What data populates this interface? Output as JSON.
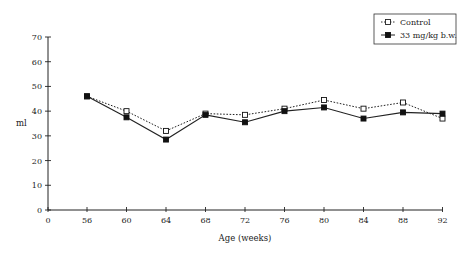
{
  "chart_data": {
    "type": "line",
    "title": "",
    "xlabel": "Age (weeks)",
    "ylabel": "ml",
    "xlim": [
      0,
      92
    ],
    "ylim": [
      0,
      70
    ],
    "x_ticks": [
      "0",
      "56",
      "60",
      "64",
      "68",
      "72",
      "76",
      "80",
      "84",
      "88",
      "92"
    ],
    "y_ticks": [
      "0",
      "10",
      "20",
      "30",
      "40",
      "50",
      "60",
      "70"
    ],
    "grid": false,
    "legend_position": "top-right",
    "x": [
      56,
      60,
      64,
      68,
      72,
      76,
      80,
      84,
      88,
      92
    ],
    "series": [
      {
        "name": "Control",
        "marker": "open-square",
        "line": "dotted",
        "values": [
          46,
          40,
          32,
          39,
          38.5,
          41,
          44.5,
          41,
          43.5,
          37
        ]
      },
      {
        "name": "33 mg/kg b.w.",
        "marker": "filled-square",
        "line": "solid",
        "values": [
          46,
          37.5,
          28.5,
          38.5,
          35.5,
          40,
          41.5,
          37,
          39.5,
          39
        ]
      }
    ]
  }
}
